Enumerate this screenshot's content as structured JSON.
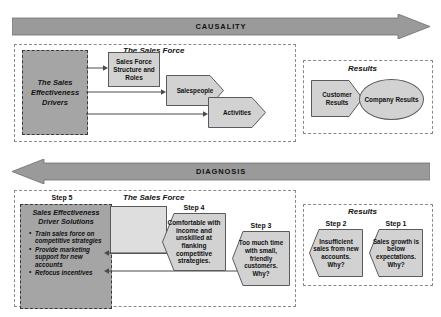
{
  "figure": {
    "bands": [
      {
        "id": "causality",
        "label": "CAUSALITY",
        "direction": "right"
      },
      {
        "id": "diagnosis",
        "label": "DIAGNOSIS",
        "direction": "left"
      }
    ],
    "top": {
      "sales_force_panel_title": "The Sales Force",
      "results_panel_title": "Results",
      "drivers_box": "The Sales Effectiveness Drivers",
      "structure_box": "Sales Force Structure and Roles",
      "salespeople_chevron": "Salespeople",
      "activities_chevron": "Activities",
      "customer_results_chevron": "Customer Results",
      "company_results_ellipse": "Company Results"
    },
    "bottom": {
      "sales_force_panel_title": "The Sales Force",
      "results_panel_title": "Results",
      "step5_label": "Step 5",
      "step4_label": "Step 4",
      "step3_label": "Step 3",
      "step2_label": "Step 2",
      "step1_label": "Step 1",
      "solutions_heading": "Sales Effectiveness Driver Solutions",
      "solutions_bullets": [
        "Train sales force on competitive strategies",
        "Provide marketing support for new accounts",
        "Refocus incentives"
      ],
      "step4_text": "Comfortable with income and unskilled at flanking competitive strategies.",
      "step3_text": "Too much time with small, friendly customers. Why?",
      "step2_text": "Insufficient sales from new accounts. Why?",
      "step1_text": "Sales growth is below expectations. Why?"
    },
    "colors": {
      "band_fill": "#9a9a9a",
      "band_stroke": "#6e6e6e",
      "dark_box_fill": "#a5a5a5",
      "light_shape_fill": "#d2d2d2",
      "empty_box_fill": "#dedede",
      "panel_dash": "#8a8a8a",
      "line": "#4a4a4a",
      "text": "#111111"
    }
  }
}
